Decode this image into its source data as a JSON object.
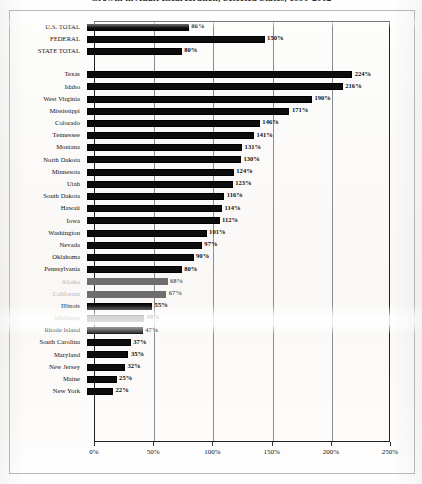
{
  "title": "Growth in Adult Incarceration, Selected States, 1990-2002",
  "chart_data": {
    "type": "bar",
    "orientation": "horizontal",
    "title": "Growth in Adult Incarceration, Selected States, 1990-2002",
    "xlabel": "",
    "ylabel": "",
    "xlim": [
      0,
      250
    ],
    "xticks": [
      0,
      50,
      100,
      150,
      200,
      250
    ],
    "xticklabels": [
      "0%",
      "50%",
      "100%",
      "150%",
      "200%",
      "250%"
    ],
    "grid": true,
    "grid_axis": "x",
    "legend": "none",
    "value_label_suffix": "%",
    "bar_color": "#0c0c0c",
    "categories": [
      "U.S. TOTAL",
      "FEDERAL",
      "STATE TOTAL",
      "Texas",
      "Idaho",
      "West Virginia",
      "Mississippi",
      "Colorado",
      "Tennessee",
      "Montana",
      "North Dakota",
      "Minnesota",
      "Utah",
      "South Dakota",
      "Hawaii",
      "Iowa",
      "Washington",
      "Nevada",
      "Oklahoma",
      "Pennsylvania",
      "Alaska",
      "California",
      "Illinois",
      "Michigan",
      "Rhode Island",
      "South Carolina",
      "Maryland",
      "New Jersey",
      "Maine",
      "New York"
    ],
    "values": [
      86,
      150,
      80,
      224,
      216,
      190,
      171,
      146,
      141,
      131,
      130,
      124,
      123,
      116,
      114,
      112,
      101,
      97,
      90,
      80,
      68,
      67,
      55,
      48,
      47,
      37,
      35,
      32,
      25,
      22
    ],
    "value_labels": [
      "86%",
      "150%",
      "80%",
      "224%",
      "216%",
      "190%",
      "171%",
      "146%",
      "141%",
      "131%",
      "130%",
      "124%",
      "123%",
      "116%",
      "114%",
      "112%",
      "101%",
      "97%",
      "90%",
      "80%",
      "68%",
      "67%",
      "55%",
      "48%",
      "47%",
      "37%",
      "35%",
      "32%",
      "25%",
      "22%"
    ],
    "group_break_after_index": 2
  }
}
